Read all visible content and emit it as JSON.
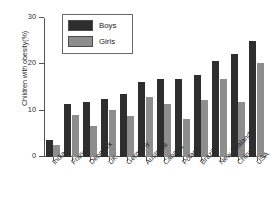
{
  "chart_data": {
    "type": "bar",
    "title": "",
    "xlabel": "",
    "ylabel": "Children with obesity(%)",
    "ylim": [
      0,
      30
    ],
    "yticks": [
      0,
      10,
      20,
      30
    ],
    "grid": false,
    "legend_position": "top-left",
    "categories": [
      "India",
      "France",
      "Denmark",
      "UK",
      "Germany",
      "Australia",
      "Canada",
      "Poland",
      "Brazil",
      "New Zealand",
      "China",
      "USA"
    ],
    "series": [
      {
        "name": "Boys",
        "color": "#2e2e2e",
        "values": [
          3.7,
          11.5,
          11.8,
          12.5,
          13.6,
          16.2,
          16.9,
          16.9,
          17.7,
          20.7,
          22.2,
          25.0
        ]
      },
      {
        "name": "Girls",
        "color": "#8d8d8d",
        "values": [
          2.6,
          9.0,
          6.7,
          10.1,
          8.9,
          13.0,
          11.5,
          8.2,
          12.3,
          16.8,
          11.8,
          20.3
        ]
      }
    ]
  },
  "axis": {
    "y_title": "Children with obesity(%)",
    "y_tick_labels": [
      "0",
      "10",
      "20",
      "30"
    ]
  },
  "legend": {
    "entries": [
      {
        "label": "Boys",
        "swatch": "boys-swatch"
      },
      {
        "label": "Girls",
        "swatch": "girls-swatch"
      }
    ]
  }
}
